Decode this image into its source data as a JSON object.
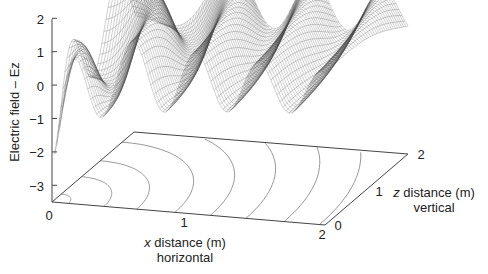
{
  "chart_data": {
    "type": "surface",
    "title": "",
    "zlabel": "Electric field – Ez",
    "xlabel": {
      "var": "x",
      "text": " distance (m)",
      "sub": "horizontal"
    },
    "ylabel": {
      "var": "z",
      "text": " distance (m)",
      "sub": "vertical"
    },
    "z_ticks": [
      "2",
      "1",
      "0",
      "−1",
      "−2",
      "−3"
    ],
    "z_tick_values": [
      2,
      1,
      0,
      -1,
      -2,
      -3
    ],
    "zlim": [
      -3.5,
      2
    ],
    "x_ticks": [
      "0",
      "1",
      "2"
    ],
    "x_tick_values": [
      0,
      1,
      2
    ],
    "xlim": [
      0,
      2
    ],
    "y_ticks": [
      "0",
      "1",
      "2"
    ],
    "y_tick_values": [
      0,
      1,
      2
    ],
    "ylim": [
      0,
      2
    ],
    "grid": false,
    "surface": {
      "description": "Mesh of Ez(x,z): damped standing wave along x, strong negative dip near x=0 rising to ~1.7 peak, ripples with ~0.45 m wavelength decaying toward x=2",
      "peak_value": 1.7,
      "min_value": -3.0,
      "mesh_color": "#555555"
    },
    "contours": {
      "count": 8,
      "shape": "concentric quarter-ellipses centred at origin on the floor plane",
      "color": "#8a8a8a"
    },
    "colors": {
      "axis": "#444444",
      "mesh": "#4a4a4a",
      "contour": "#8c8c8c",
      "text": "#222222"
    }
  }
}
